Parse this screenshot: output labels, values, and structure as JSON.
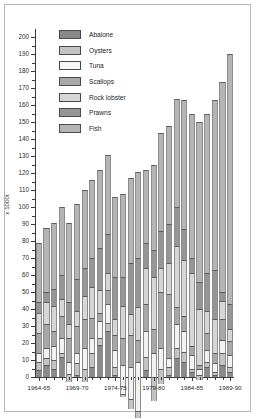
{
  "chart_data": {
    "type": "bar",
    "stacked": true,
    "title": "",
    "subtitle": "",
    "xlabel": "",
    "ylabel": "x 1000t",
    "ylim": [
      0,
      205
    ],
    "ytick_step": 10,
    "yticks": [
      0,
      10,
      20,
      30,
      40,
      50,
      60,
      70,
      80,
      90,
      100,
      110,
      120,
      130,
      140,
      150,
      160,
      170,
      180,
      190,
      200
    ],
    "grid": false,
    "legend_position": "top-left",
    "categories": [
      "1964-65",
      "1965-66",
      "1966-67",
      "1967-68",
      "1968-69",
      "1969-70",
      "1970-71",
      "1971-72",
      "1972-73",
      "1973-74",
      "1974-75",
      "1975-76",
      "1976-77",
      "1977-78",
      "1978-79",
      "1979-80",
      "1980-81",
      "1981-82",
      "1982-83",
      "1983-84",
      "1984-85",
      "1985-86",
      "1986-87",
      "1987-88",
      "1988-89",
      "1989-90"
    ],
    "xtick_labels": [
      "1964-65",
      "1969-70",
      "1974-75",
      "1979-80",
      "1984-85",
      "1989-90"
    ],
    "xtick_indices": [
      0,
      5,
      10,
      15,
      20,
      25
    ],
    "series": [
      {
        "name": "Fish",
        "color": "#b5b5b5",
        "values": [
          35,
          38,
          39,
          40,
          47,
          44,
          46,
          46,
          46,
          47,
          47,
          49,
          50,
          51,
          43,
          58,
          58,
          64,
          76,
          85,
          94,
          94,
          100,
          124,
          47,
          129
        ]
      },
      {
        "name": "Prawns",
        "color": "#969696",
        "values": [
          41,
          44,
          49,
          54,
          60,
          63,
          62,
          63,
          71,
          70,
          72,
          66,
          80,
          80,
          58,
          80,
          87,
          93,
          86,
          94,
          116,
          147,
          105,
          129,
          50,
          125
        ]
      },
      {
        "name": "Rock lobster",
        "color": "#d6d6d6",
        "values": [
          53,
          57,
          64,
          64,
          68,
          72,
          76,
          81,
          84,
          80,
          81,
          85,
          92,
          99,
          79,
          99,
          94,
          98,
          105,
          104,
          120,
          152,
          110,
          140,
          57,
          136
        ]
      },
      {
        "name": "Scallops",
        "color": "#a8a8a8",
        "values": [
          65,
          71,
          73,
          77,
          82,
          88,
          93,
          93,
          89,
          88,
          90,
          101,
          111,
          112,
          95,
          111,
          127,
          137,
          129,
          136,
          145,
          162,
          129,
          152,
          65,
          147
        ]
      },
      {
        "name": "Tuna",
        "color": "#f2f2f2",
        "values": [
          70,
          77,
          81,
          86,
          89,
          94,
          105,
          102,
          99,
          99,
          100,
          118,
          130,
          141,
          110,
          130,
          139,
          142,
          147,
          148,
          153,
          177,
          140,
          160,
          72,
          160
        ]
      },
      {
        "name": "Oysters",
        "color": "#c4c4c4",
        "values": [
          75,
          81,
          86,
          88,
          94,
          101,
          113,
          110,
          103,
          104,
          105,
          120,
          136,
          145,
          118,
          139,
          148,
          147,
          153,
          154,
          159,
          184,
          146,
          167,
          77,
          166
        ]
      },
      {
        "name": "Abalone",
        "color": "#8a8a8a",
        "values": [
          79,
          88,
          91,
          100,
          91,
          102,
          110,
          116,
          122,
          131,
          106,
          108,
          117,
          121,
          122,
          125,
          144,
          148,
          164,
          163,
          155,
          190,
          150,
          155,
          80,
          163
        ]
      }
    ],
    "cumulative_tops": [
      79,
      88,
      91,
      100,
      91,
      102,
      110,
      116,
      122,
      131,
      106,
      108,
      117,
      121,
      122,
      125,
      144,
      148,
      164,
      163,
      155,
      150,
      155,
      163,
      174,
      190
    ],
    "stack_totals": {
      "note": "Values are cumulative stack tops read off the y-axis per segment boundary",
      "segment_boundaries": [
        [
          35,
          41,
          53,
          65,
          70,
          75,
          79
        ],
        [
          38,
          44,
          57,
          71,
          77,
          81,
          88
        ],
        [
          39,
          49,
          64,
          73,
          81,
          86,
          91
        ],
        [
          40,
          54,
          64,
          77,
          86,
          88,
          100
        ],
        [
          47,
          60,
          68,
          82,
          89,
          94,
          91
        ],
        [
          44,
          63,
          72,
          88,
          94,
          101,
          102
        ],
        [
          46,
          62,
          76,
          93,
          105,
          113,
          110
        ],
        [
          46,
          63,
          81,
          93,
          102,
          110,
          116
        ],
        [
          46,
          71,
          84,
          89,
          99,
          103,
          122
        ],
        [
          47,
          70,
          80,
          88,
          99,
          104,
          131
        ],
        [
          47,
          72,
          81,
          90,
          100,
          105,
          106
        ],
        [
          49,
          66,
          85,
          101,
          118,
          120,
          108
        ],
        [
          50,
          80,
          92,
          111,
          130,
          136,
          117
        ],
        [
          51,
          80,
          99,
          112,
          141,
          145,
          121
        ],
        [
          43,
          58,
          79,
          95,
          110,
          118,
          122
        ],
        [
          50,
          66,
          97,
          111,
          125,
          139,
          125
        ],
        [
          58,
          80,
          94,
          127,
          139,
          148,
          144
        ],
        [
          58,
          81,
          99,
          137,
          142,
          147,
          148
        ],
        [
          64,
          87,
          123,
          133,
          147,
          153,
          164
        ],
        [
          76,
          94,
          127,
          136,
          148,
          154,
          163
        ],
        [
          85,
          94,
          137,
          142,
          150,
          152,
          155
        ],
        [
          94,
          110,
          143,
          145,
          149,
          152,
          150
        ],
        [
          94,
          116,
          129,
          139,
          146,
          149,
          155
        ],
        [
          100,
          129,
          149,
          155,
          160,
          162,
          163
        ],
        [
          124,
          129,
          140,
          152,
          160,
          167,
          174
        ],
        [
          147,
          162,
          169,
          177,
          184,
          187,
          190
        ]
      ]
    }
  },
  "legend": {
    "items": [
      {
        "label": "Abalone",
        "color": "#8a8a8a"
      },
      {
        "label": "Oysters",
        "color": "#c4c4c4"
      },
      {
        "label": "Tuna",
        "color": "#f7f7f7"
      },
      {
        "label": "Scallops",
        "color": "#a8a8a8"
      },
      {
        "label": "Rock lobster",
        "color": "#d6d6d6"
      },
      {
        "label": "Prawns",
        "color": "#969696"
      },
      {
        "label": "Fish",
        "color": "#b5b5b5"
      }
    ]
  }
}
